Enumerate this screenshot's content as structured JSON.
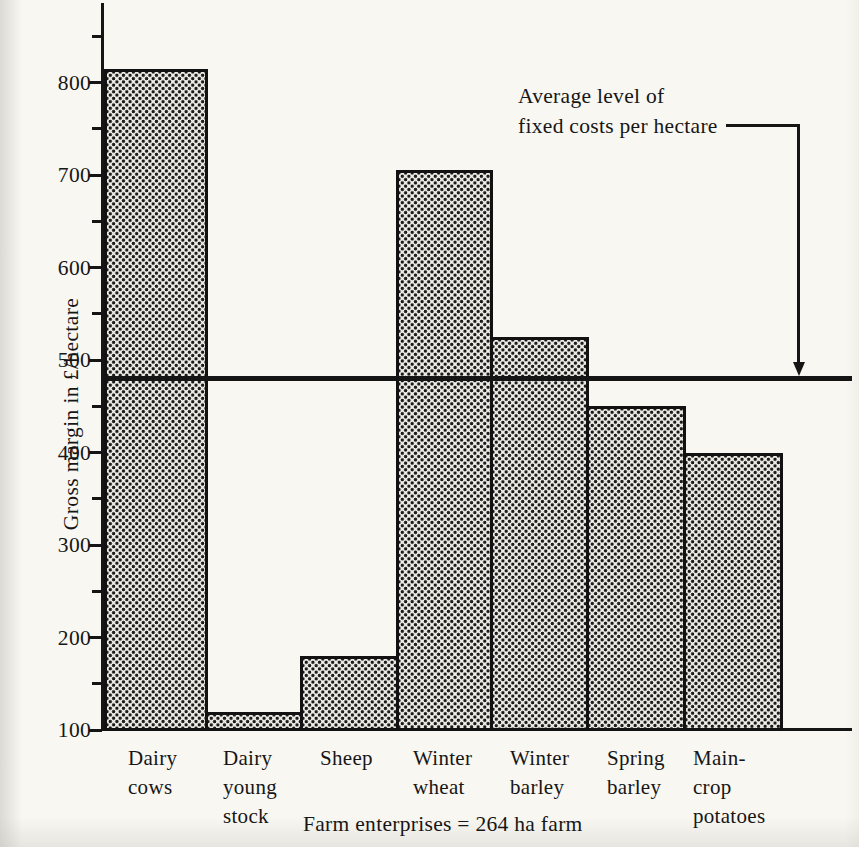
{
  "page": {
    "paper_color": "#f9f7f2",
    "ink_color": "#151515",
    "bar_fill": "halftone-dot-pattern"
  },
  "chart_data": {
    "type": "bar",
    "title": "",
    "ylabel": "Gross margin in £/hectare",
    "xlabel": "Farm enterprises = 264 ha farm",
    "ylim": [
      100,
      860
    ],
    "grid": false,
    "ytick_major": [
      100,
      200,
      300,
      400,
      500,
      600,
      700,
      800
    ],
    "ytick_minor": [
      150,
      250,
      350,
      450,
      550,
      650,
      750,
      850
    ],
    "categories": [
      "Dairy cows",
      "Dairy young stock",
      "Sheep",
      "Winter wheat",
      "Winter barley",
      "Spring barley",
      "Main-crop potatoes"
    ],
    "category_label_lines": [
      [
        "Dairy",
        "cows"
      ],
      [
        "Dairy",
        "young",
        "stock"
      ],
      [
        "Sheep"
      ],
      [
        "Winter",
        "wheat"
      ],
      [
        "Winter",
        "barley"
      ],
      [
        "Spring",
        "barley"
      ],
      [
        "Main-",
        "crop",
        "potatoes"
      ]
    ],
    "values": [
      815,
      120,
      180,
      705,
      525,
      450,
      400
    ],
    "reference_line": {
      "value": 480,
      "label_line1": "Average level of",
      "label_line2": "fixed costs per hectare"
    }
  }
}
